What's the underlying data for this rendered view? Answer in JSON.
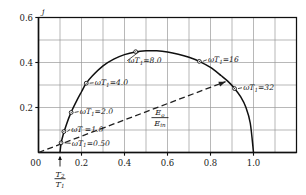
{
  "chart_data": {
    "type": "line",
    "title": "",
    "xlabel": "T2/T1",
    "ylabel": "j",
    "xlim": [
      0,
      1.2
    ],
    "ylim": [
      0,
      0.6
    ],
    "grid": true,
    "x_ticks": [
      "0",
      "0.2",
      "0.4",
      "0.6",
      "0.8",
      "1.0"
    ],
    "x_tick_values": [
      0,
      0.2,
      0.4,
      0.6,
      0.8,
      1.0
    ],
    "y_ticks": [
      "0.2",
      "0.4",
      "0.6"
    ],
    "y_tick_values": [
      0.2,
      0.4,
      0.6
    ],
    "x_minor_step": 0.1,
    "y_minor_step": 0.1,
    "series": [
      {
        "name": "efficiency-curve",
        "style": "solid",
        "x": [
          0.1,
          0.105,
          0.115,
          0.13,
          0.15,
          0.175,
          0.2,
          0.22,
          0.25,
          0.3,
          0.35,
          0.4,
          0.45,
          0.5,
          0.55,
          0.6,
          0.65,
          0.7,
          0.75,
          0.8,
          0.85,
          0.88,
          0.91,
          0.94,
          0.965,
          0.985,
          1.0
        ],
        "y": [
          0.0,
          0.04,
          0.08,
          0.125,
          0.175,
          0.225,
          0.27,
          0.305,
          0.34,
          0.385,
          0.415,
          0.435,
          0.447,
          0.452,
          0.452,
          0.447,
          0.437,
          0.423,
          0.404,
          0.378,
          0.341,
          0.317,
          0.287,
          0.248,
          0.2,
          0.13,
          0.0
        ]
      },
      {
        "name": "Eo-over-Ein-line",
        "style": "dashed",
        "x": [
          0.0,
          0.87
        ],
        "y": [
          0.0,
          0.315
        ]
      }
    ],
    "markers": [
      {
        "label": "ωT₁=0.50",
        "omega_t1": 0.5,
        "x": 0.105,
        "y": 0.043,
        "label_x": 0.155,
        "label_y": 0.031,
        "anchor": "start"
      },
      {
        "label": "ωT =1.0",
        "omega_t1": 1.0,
        "x": 0.118,
        "y": 0.093,
        "label_x": 0.152,
        "label_y": 0.092,
        "anchor": "start"
      },
      {
        "label": "ωT₁=2.0",
        "omega_t1": 2.0,
        "x": 0.152,
        "y": 0.178,
        "label_x": 0.192,
        "label_y": 0.172,
        "anchor": "start"
      },
      {
        "label": "ωT₁=4.0",
        "omega_t1": 4.0,
        "x": 0.222,
        "y": 0.308,
        "label_x": 0.262,
        "label_y": 0.3,
        "anchor": "start"
      },
      {
        "label": "ωT₁=8.0",
        "omega_t1": 8.0,
        "x": 0.452,
        "y": 0.448,
        "label_x": 0.418,
        "label_y": 0.398,
        "anchor": "start"
      },
      {
        "label": "ωT₁=16",
        "omega_t1": 16,
        "x": 0.748,
        "y": 0.405,
        "label_x": 0.788,
        "label_y": 0.402,
        "anchor": "start"
      },
      {
        "label": "ωT₁=32",
        "omega_t1": 32,
        "x": 0.912,
        "y": 0.284,
        "label_x": 0.952,
        "label_y": 0.278,
        "anchor": "start"
      }
    ],
    "annotations": [
      {
        "name": "ratio-label",
        "numerator": "E",
        "numerator_sub": "o",
        "denominator": "E",
        "denominator_sub": "in",
        "x": 0.565,
        "y": 0.155
      },
      {
        "name": "y-axis-symbol",
        "text": "j"
      },
      {
        "name": "x-origin-label",
        "text": "0"
      },
      {
        "name": "t-ratio-label",
        "numerator": "T",
        "numerator_sub": "2",
        "denominator": "T",
        "denominator_sub": "1",
        "arrow_x": 0.1
      }
    ],
    "colors": {
      "curve": "#101010",
      "dashed": "#202020",
      "grid": "#9a9a9a",
      "axis": "#101010",
      "background": "#ffffff"
    }
  }
}
